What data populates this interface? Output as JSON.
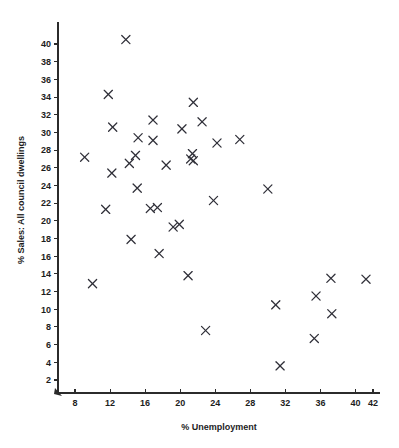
{
  "chart_data": {
    "type": "scatter",
    "title": "",
    "xlabel": "% Unemployment",
    "ylabel": "% Sales: All council dwellings",
    "xlim": [
      6.5,
      42.5
    ],
    "ylim": [
      1.0,
      42.0
    ],
    "xticks": [
      8,
      12,
      16,
      20,
      24,
      28,
      32,
      36,
      40,
      42
    ],
    "yticks": [
      2,
      4,
      6,
      8,
      10,
      12,
      14,
      16,
      18,
      20,
      22,
      24,
      26,
      28,
      30,
      32,
      34,
      36,
      38,
      40
    ],
    "xtick_labels": [
      "8",
      "12",
      "16",
      "20",
      "24",
      "28",
      "32",
      "36",
      "40",
      "42"
    ],
    "ytick_labels": [
      "2",
      "4",
      "6",
      "8",
      "10",
      "12",
      "14",
      "16",
      "18",
      "20",
      "22",
      "24",
      "26",
      "28",
      "30",
      "32",
      "34",
      "36",
      "38",
      "40"
    ],
    "grid": false,
    "legend": false,
    "marker": "x",
    "marker_color": "#2f2f38",
    "points": [
      {
        "x": 13.8,
        "y": 40.5
      },
      {
        "x": 11.8,
        "y": 34.3
      },
      {
        "x": 21.5,
        "y": 33.4
      },
      {
        "x": 16.9,
        "y": 31.4
      },
      {
        "x": 22.5,
        "y": 31.2
      },
      {
        "x": 12.3,
        "y": 30.6
      },
      {
        "x": 20.2,
        "y": 30.4
      },
      {
        "x": 15.2,
        "y": 29.4
      },
      {
        "x": 26.8,
        "y": 29.2
      },
      {
        "x": 16.9,
        "y": 29.1
      },
      {
        "x": 24.2,
        "y": 28.8
      },
      {
        "x": 21.4,
        "y": 27.6
      },
      {
        "x": 14.9,
        "y": 27.4
      },
      {
        "x": 9.1,
        "y": 27.2
      },
      {
        "x": 21.2,
        "y": 27.0
      },
      {
        "x": 21.5,
        "y": 26.8
      },
      {
        "x": 14.2,
        "y": 26.5
      },
      {
        "x": 18.4,
        "y": 26.3
      },
      {
        "x": 12.2,
        "y": 25.4
      },
      {
        "x": 15.1,
        "y": 23.7
      },
      {
        "x": 30.0,
        "y": 23.6
      },
      {
        "x": 23.8,
        "y": 22.3
      },
      {
        "x": 17.4,
        "y": 21.5
      },
      {
        "x": 16.6,
        "y": 21.4
      },
      {
        "x": 11.5,
        "y": 21.3
      },
      {
        "x": 19.9,
        "y": 19.6
      },
      {
        "x": 19.2,
        "y": 19.3
      },
      {
        "x": 14.4,
        "y": 17.9
      },
      {
        "x": 17.6,
        "y": 16.3
      },
      {
        "x": 20.9,
        "y": 13.8
      },
      {
        "x": 37.2,
        "y": 13.5
      },
      {
        "x": 41.2,
        "y": 13.4
      },
      {
        "x": 10.0,
        "y": 12.9
      },
      {
        "x": 35.5,
        "y": 11.5
      },
      {
        "x": 30.9,
        "y": 10.5
      },
      {
        "x": 37.3,
        "y": 9.5
      },
      {
        "x": 22.9,
        "y": 7.6
      },
      {
        "x": 35.3,
        "y": 6.7
      },
      {
        "x": 31.4,
        "y": 3.6
      }
    ]
  },
  "figure": {
    "axes_name": "scatter-plot-axes",
    "background": "#ffffff"
  }
}
